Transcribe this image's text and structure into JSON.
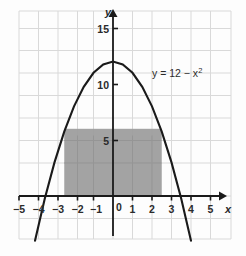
{
  "figure": {
    "title": "",
    "x_axis_name": "x",
    "y_axis_name": "y",
    "curve_label": "y = 12 − x",
    "curve_label_exponent": "2",
    "x_tick_labels": [
      "−5",
      "−4",
      "−3",
      "−2",
      "−1",
      "0",
      "1",
      "2",
      "3",
      "4",
      "5"
    ],
    "y_tick_labels": [
      "5",
      "10",
      "15"
    ],
    "colors": {
      "grid": "#d8d8d8",
      "axis": "#1a1a1a",
      "curve": "#1a1a1a",
      "shade": "#9e9e9e",
      "background": "#fdfdfd",
      "text": "#2b2b2b"
    }
  },
  "chart_data": {
    "type": "line",
    "title": "",
    "xlabel": "x",
    "ylabel": "y",
    "xlim": [
      -6,
      6
    ],
    "ylim": [
      -3,
      17
    ],
    "grid": true,
    "legend": "none",
    "xticks": [
      -5,
      -4,
      -3,
      -2,
      -1,
      0,
      1,
      2,
      3,
      4,
      5
    ],
    "yticks": [
      5,
      10,
      15
    ],
    "annotations": [
      {
        "text": "y = 12 − x²",
        "x": 1.8,
        "y": 11.0
      }
    ],
    "series": [
      {
        "name": "y = 12 - x^2",
        "equation": "y = 12 - x^2",
        "vertex": [
          0,
          12
        ],
        "roots": [
          -3.464,
          3.464
        ],
        "x": [
          -4.0,
          -3.5,
          -3.0,
          -2.5,
          -2.0,
          -1.5,
          -1.0,
          -0.5,
          0.0,
          0.5,
          1.0,
          1.5,
          2.0,
          2.5,
          3.0,
          3.5,
          4.0
        ],
        "values": [
          -4.0,
          -0.25,
          3.0,
          5.75,
          8.0,
          9.75,
          11.0,
          11.75,
          12.0,
          11.75,
          11.0,
          9.75,
          8.0,
          5.75,
          3.0,
          -0.25,
          -4.0
        ]
      }
    ],
    "shaded_region": {
      "type": "rectangle",
      "label": "inscribed rectangle",
      "x_left": -2.5,
      "x_right": 2.5,
      "y_bottom": 0,
      "y_top": 6,
      "width": 5,
      "height": 6,
      "area": 30,
      "color": "#9e9e9e"
    }
  }
}
